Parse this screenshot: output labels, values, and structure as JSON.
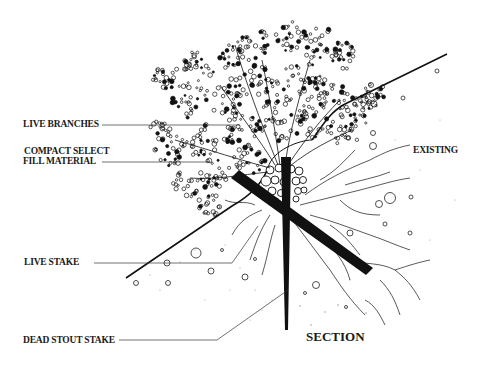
{
  "diagram": {
    "title": "SECTION",
    "colors": {
      "ink": "#111111",
      "background": "#ffffff"
    },
    "labels": {
      "live_branches": "LIVE BRANCHES",
      "fill_line1": "COMPACT SELECT",
      "fill_line2": "FILL MATERIAL",
      "existing": "EXISTING",
      "live_stake": "LIVE STAKE",
      "dead_stout_stake": "DEAD STOUT STAKE"
    }
  }
}
